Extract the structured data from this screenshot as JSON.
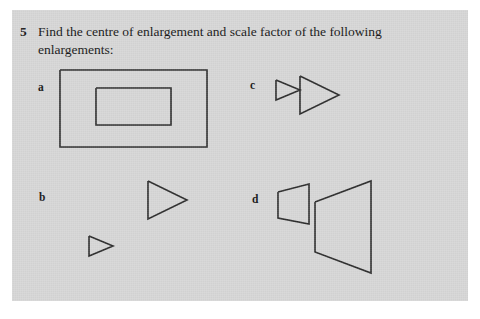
{
  "page": {
    "background_color": "#d6d6d6",
    "paper_color": "#ffffff",
    "ink_color": "#2a2a2a"
  },
  "question": {
    "number": "5",
    "text": "Find the centre of enlargement and scale factor of the following enlargements:"
  },
  "figures": [
    {
      "label": "a",
      "description": "two concentric rectangles, small rectangle inside large rectangle",
      "shapes": [
        {
          "name": "outer-rectangle",
          "type": "rect",
          "points": "0,0 147,0 147,77 0,77 0,0"
        },
        {
          "name": "inner-rectangle",
          "type": "rect",
          "points": "36,18 111,18 111,55 36,55 36,18"
        }
      ]
    },
    {
      "label": "b",
      "description": "two similar right-angled triangles with vertical left side and hypotenuse falling to bottom-left",
      "shapes": [
        {
          "name": "small-triangle",
          "type": "triangle",
          "points": "0,0 19,0 0,38 0,0"
        },
        {
          "name": "large-triangle",
          "type": "triangle",
          "points": "0,0 43,0 0,91 0,0"
        }
      ]
    },
    {
      "label": "c",
      "description": "two similar right-pointing triangles sharing a near-common apex region",
      "shapes": [
        {
          "name": "small-triangle",
          "type": "triangle",
          "points": "0,4 24,14 0,24 0,4"
        },
        {
          "name": "large-triangle",
          "type": "triangle",
          "points": "24,0 63,19 24,38 24,0"
        }
      ]
    },
    {
      "label": "d",
      "description": "two similar trapezoids, narrow vertical side on the left and wide vertical side on the right",
      "shapes": [
        {
          "name": "small-trapezoid",
          "type": "trapezoid",
          "points": "0,11 31,3 31,43 0,37 0,11"
        },
        {
          "name": "large-trapezoid",
          "type": "trapezoid",
          "points": "37,21 93,0 93,92 37,71 37,21"
        }
      ]
    }
  ]
}
